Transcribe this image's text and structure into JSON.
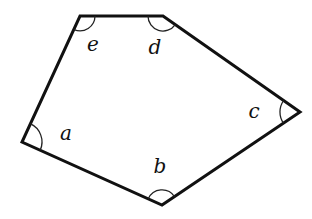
{
  "figure": {
    "type": "pentagon-with-labeled-angles",
    "stroke_color": "#111111",
    "background": "#ffffff",
    "vertices": [
      {
        "name": "e",
        "x": 80,
        "y": 16
      },
      {
        "name": "d",
        "x": 163,
        "y": 16
      },
      {
        "name": "c",
        "x": 300,
        "y": 112
      },
      {
        "name": "b",
        "x": 162,
        "y": 205
      },
      {
        "name": "a",
        "x": 22,
        "y": 142
      }
    ],
    "angles": [
      {
        "label": "a",
        "label_x": 66,
        "label_y": 140
      },
      {
        "label": "b",
        "label_x": 160,
        "label_y": 173
      },
      {
        "label": "c",
        "label_x": 254,
        "label_y": 118
      },
      {
        "label": "d",
        "label_x": 155,
        "label_y": 54
      },
      {
        "label": "e",
        "label_x": 93,
        "label_y": 51
      }
    ]
  }
}
